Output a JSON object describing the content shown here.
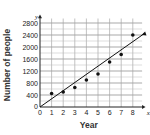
{
  "chart_data": {
    "type": "scatter",
    "title": "",
    "xlabel": "Year",
    "ylabel": "Number of people",
    "x_axis_letter": "x",
    "y_axis_letter": "y",
    "x_ticks": [
      0,
      1,
      2,
      3,
      4,
      5,
      6,
      7,
      8
    ],
    "y_ticks": [
      0,
      400,
      800,
      1200,
      1600,
      2000,
      2400,
      2800
    ],
    "xlim": [
      0,
      9
    ],
    "ylim": [
      0,
      3000
    ],
    "grid": true,
    "legend": null,
    "series": [
      {
        "name": "data",
        "x": [
          1,
          2,
          3,
          4,
          5,
          6,
          7,
          8
        ],
        "y": [
          450,
          500,
          650,
          900,
          1100,
          1500,
          1750,
          2400
        ]
      }
    ],
    "trend_line": {
      "from": [
        0,
        0
      ],
      "to": [
        9,
        2450
      ],
      "arrow": true
    }
  }
}
